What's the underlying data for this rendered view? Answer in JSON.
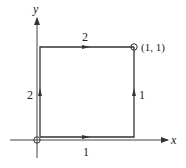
{
  "diagram": {
    "type": "path-integral-contours",
    "axes": {
      "x_label": "x",
      "y_label": "y"
    },
    "points": {
      "origin_label": "",
      "end_label": "(1, 1)"
    },
    "paths": [
      {
        "name": "1",
        "label": "1",
        "description": "origin along x-axis to (1,0), then up to (1,1)",
        "bottom_label": "1",
        "right_label": "1"
      },
      {
        "name": "2",
        "label": "2",
        "description": "origin up y-axis to (0,1), then right to (1,1)",
        "left_label": "2",
        "top_label": "2"
      }
    ],
    "colors": {
      "line": "#333333",
      "background": "#ffffff"
    }
  }
}
